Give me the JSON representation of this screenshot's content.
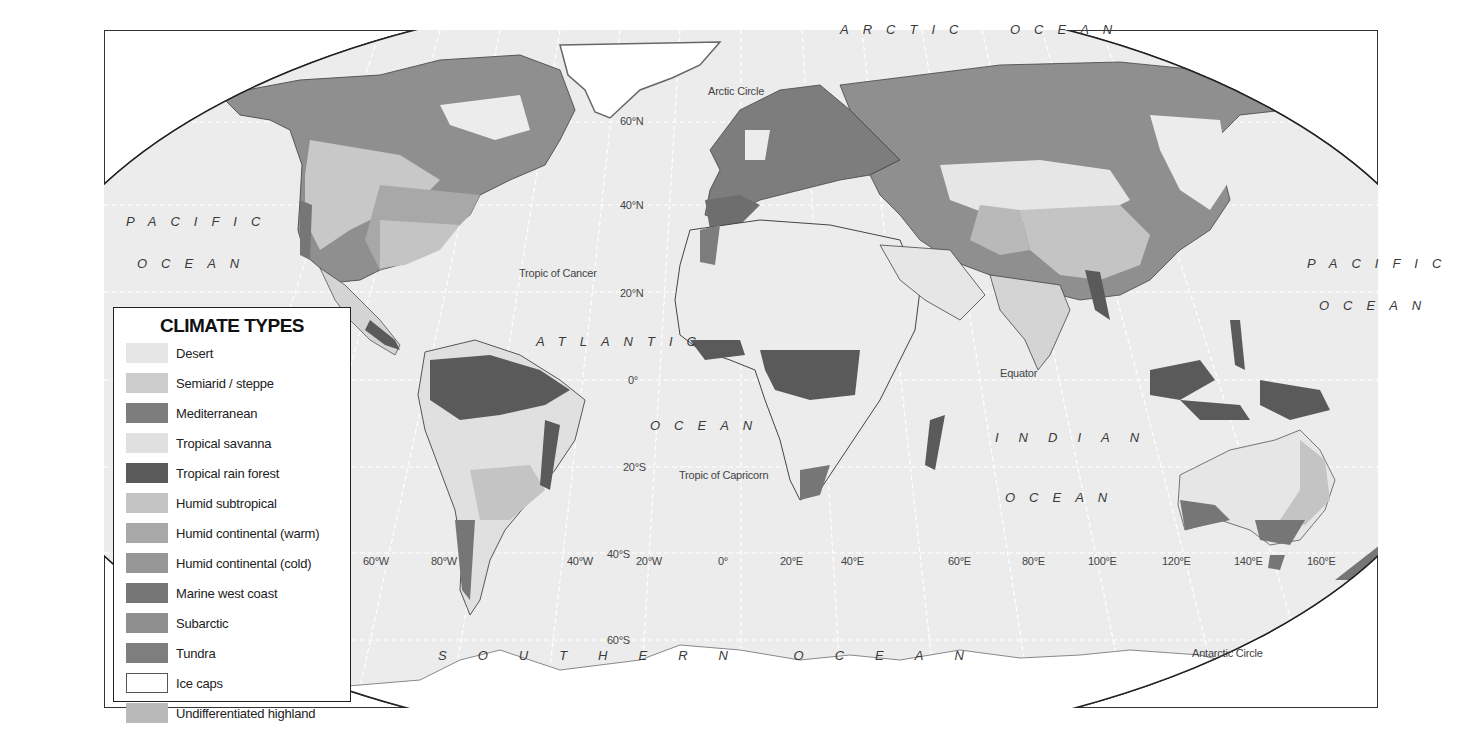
{
  "legend": {
    "title": "CLIMATE TYPES",
    "items": [
      {
        "label": "Desert",
        "color": "#e6e6e6",
        "border": "none"
      },
      {
        "label": "Semiarid / steppe",
        "color": "#cdcdcd",
        "border": "none"
      },
      {
        "label": "Mediterranean",
        "color": "#7d7d7d",
        "border": "none"
      },
      {
        "label": "Tropical savanna",
        "color": "#e0e0e0",
        "border": "none"
      },
      {
        "label": "Tropical rain forest",
        "color": "#5a5a5a",
        "border": "none"
      },
      {
        "label": "Humid subtropical",
        "color": "#c4c4c4",
        "border": "none"
      },
      {
        "label": "Humid continental (warm)",
        "color": "#a8a8a8",
        "border": "none"
      },
      {
        "label": "Humid continental (cold)",
        "color": "#979797",
        "border": "none"
      },
      {
        "label": "Marine west coast",
        "color": "#767676",
        "border": "none"
      },
      {
        "label": "Subarctic",
        "color": "#8f8f8f",
        "border": "none"
      },
      {
        "label": "Tundra",
        "color": "#7e7e7e",
        "border": "none"
      },
      {
        "label": "Ice caps",
        "color": "#ffffff",
        "border": "1px solid #555"
      },
      {
        "label": "Undifferentiated highland",
        "color": "#b9b9b9",
        "border": "none"
      }
    ]
  },
  "oceans": {
    "arctic_1": "ARCTIC",
    "arctic_2": "OCEAN",
    "pacific_west_1": "PACIFIC",
    "pacific_west_2": "OCEAN",
    "pacific_east_1": "PACIFIC",
    "pacific_east_2": "OCEAN",
    "atlantic_1": "ATLANTIC",
    "atlantic_2": "OCEAN",
    "indian_1": "INDIAN",
    "indian_2": "OCEAN",
    "southern": "SOUTHERN OCEAN"
  },
  "reference_lines": {
    "arctic_circle": "Arctic Circle",
    "tropic_cancer": "Tropic of Cancer",
    "equator": "Equator",
    "tropic_capricorn": "Tropic of Capricorn",
    "antarctic_circle": "Antarctic Circle"
  },
  "latitudes": [
    "60°N",
    "40°N",
    "20°N",
    "0°",
    "20°S",
    "40°S",
    "60°S"
  ],
  "longitudes": [
    "60°W",
    "80°W",
    "40°W",
    "20°W",
    "0°",
    "20°E",
    "40°E",
    "60°E",
    "80°E",
    "100°E",
    "120°E",
    "140°E",
    "160°E"
  ],
  "colors": {
    "ocean": "#ececec",
    "land_base": "#e6e6e6",
    "border": "#333333",
    "graticule": "#ffffff"
  }
}
